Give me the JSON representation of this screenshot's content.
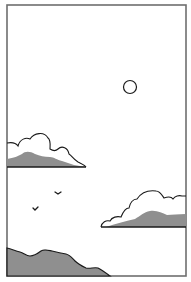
{
  "scene": {
    "title": "Sky illustration panel",
    "colors": {
      "background": "#ffffff",
      "frame": "#6e6e6e",
      "outline": "#1a1a1a",
      "shade": "#8f8f8f"
    },
    "elements": [
      "frame",
      "sun",
      "upper-cloud",
      "lower-cloud",
      "birds",
      "hill"
    ]
  }
}
